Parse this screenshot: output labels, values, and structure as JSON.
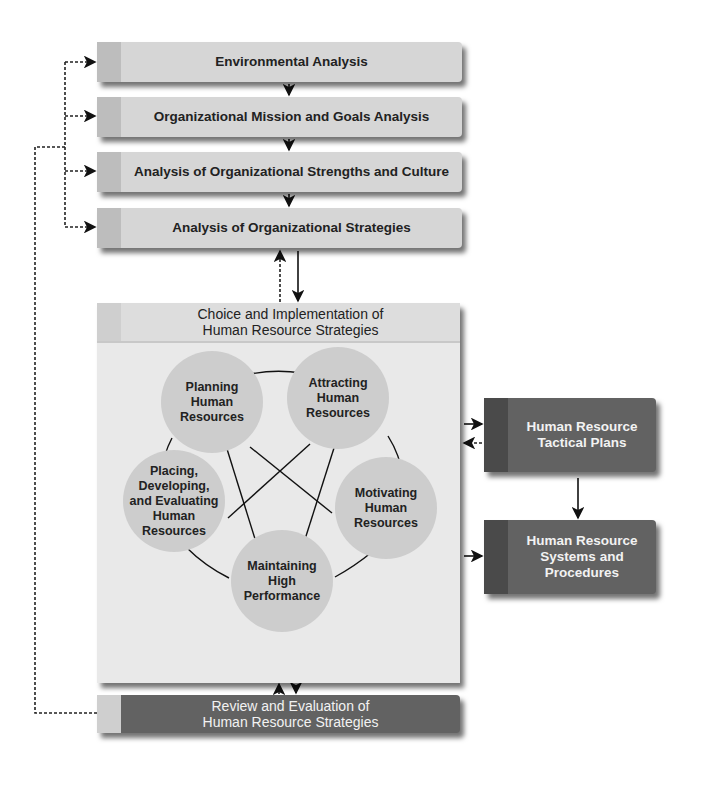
{
  "analysis_steps": [
    {
      "label": "Environmental Analysis"
    },
    {
      "label": "Organizational Mission and Goals Analysis"
    },
    {
      "label": "Analysis of Organizational Strengths and Culture"
    },
    {
      "label": "Analysis of Organizational Strategies"
    }
  ],
  "choice_box": {
    "title_line1": "Choice and Implementation of",
    "title_line2": "Human Resource Strategies",
    "circles": [
      {
        "line1": "Planning",
        "line2": "Human",
        "line3": "Resources"
      },
      {
        "line1": "Attracting",
        "line2": "Human",
        "line3": "Resources"
      },
      {
        "line1": "Placing,",
        "line2": "Developing,",
        "line3": "and Evaluating",
        "line4": "Human",
        "line5": "Resources"
      },
      {
        "line1": "Motivating",
        "line2": "Human",
        "line3": "Resources"
      },
      {
        "line1": "Maintaining",
        "line2": "High",
        "line3": "Performance"
      }
    ]
  },
  "tactical_plans": {
    "line1": "Human Resource",
    "line2": "Tactical Plans"
  },
  "systems_procedures": {
    "line1": "Human Resource",
    "line2": "Systems and",
    "line3": "Procedures"
  },
  "review": {
    "line1": "Review and Evaluation of",
    "line2": "Human Resource Strategies"
  },
  "colors": {
    "light_box": "#d6d6d6",
    "dark_box": "#626262",
    "circle": "#cdcdcd",
    "panel": "#e9e9e9"
  }
}
